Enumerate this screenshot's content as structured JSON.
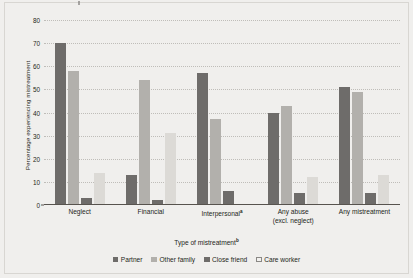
{
  "chart_data": {
    "type": "bar",
    "title": "",
    "xlabel": "Type of mistreatment",
    "xlabel_superscript": "b",
    "ylabel": "Percentage experiencing mistreatment",
    "ylim": [
      0,
      80
    ],
    "ytick_step": 10,
    "yticks": [
      0,
      10,
      20,
      30,
      40,
      50,
      60,
      70,
      80
    ],
    "grid": true,
    "legend_position": "bottom",
    "categories": [
      "Neglect",
      "Financial",
      "Interpersonal",
      "Any abuse (excl. neglect)",
      "Any mistreatment"
    ],
    "category_labels": [
      {
        "line1": "Neglect",
        "line2": "",
        "superscript": ""
      },
      {
        "line1": "Financial",
        "line2": "",
        "superscript": ""
      },
      {
        "line1": "Interpersonal",
        "line2": "",
        "superscript": "a"
      },
      {
        "line1": "Any abuse",
        "line2": "(excl. neglect)",
        "superscript": ""
      },
      {
        "line1": "Any mistreatment",
        "line2": "",
        "superscript": ""
      }
    ],
    "series": [
      {
        "name": "Partner",
        "color": "#6e6c6a",
        "values": [
          70,
          13,
          57,
          40,
          51
        ]
      },
      {
        "name": "Other family",
        "color": "#b2b0ac",
        "values": [
          58,
          54,
          37,
          43,
          49
        ]
      },
      {
        "name": "Close friend",
        "color": "#6e6c6a",
        "values": [
          3,
          2,
          6,
          5,
          5
        ]
      },
      {
        "name": "Care worker",
        "color": "#dcdad6",
        "values": [
          14,
          31,
          null,
          12,
          13
        ]
      }
    ]
  },
  "legend": {
    "items": [
      {
        "label": "Partner"
      },
      {
        "label": "Other family"
      },
      {
        "label": "Close friend"
      },
      {
        "label": "Care worker"
      }
    ]
  }
}
